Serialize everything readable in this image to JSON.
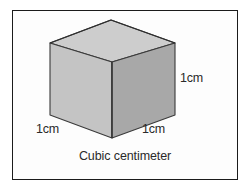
{
  "figure": {
    "caption": "Cubic centimeter",
    "shape_name": "cube",
    "labels": {
      "height": "1cm",
      "depth_left": "1cm",
      "width_right": "1cm"
    },
    "colors": {
      "top_face": "#cdcdcd",
      "left_face": "#c4c4c4",
      "right_face": "#a8a8a8",
      "outline": "#3a3a3a",
      "frame": "#1b1b1b",
      "background": "#ffffff",
      "text": "#2a2a2a"
    },
    "geometry": {
      "top_apex": [
        111,
        20
      ],
      "left_vertex": [
        50,
        43
      ],
      "right_vertex": [
        175,
        43
      ],
      "front_vertex": [
        112,
        62
      ],
      "bottom_left": [
        50,
        115
      ],
      "bottom_front": [
        112,
        138
      ],
      "bottom_right": [
        175,
        115
      ]
    }
  }
}
